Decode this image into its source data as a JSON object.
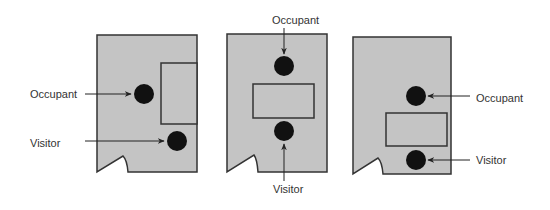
{
  "colors": {
    "room_fill": "#c4c4c4",
    "stroke": "#333333",
    "person": "#111111",
    "text": "#333333",
    "background": "#ffffff"
  },
  "legend_labels": {
    "occupant": "Occupant",
    "visitor": "Visitor"
  },
  "layouts": [
    {
      "id": "layout-1",
      "description": "Desk against right wall; occupant left of desk, visitor below-right near door side",
      "room": {
        "x1": 97,
        "y1": 35,
        "x2": 197,
        "y2": 172
      },
      "door_notch": {
        "left": [
          97,
          172
        ],
        "apex": [
          123,
          156
        ],
        "end": [
          128,
          172
        ]
      },
      "desk": {
        "x": 161,
        "y": 63,
        "w": 36,
        "h": 61
      },
      "occupant": {
        "cx": 144,
        "cy": 94,
        "r": 10,
        "label": "Occupant",
        "label_x": 30,
        "label_y": 98,
        "arrow": [
          [
            85,
            94
          ],
          [
            131,
            94
          ]
        ]
      },
      "visitor": {
        "cx": 177,
        "cy": 141,
        "r": 10,
        "label": "Visitor",
        "label_x": 30,
        "label_y": 147,
        "arrow": [
          [
            85,
            141
          ],
          [
            164,
            141
          ]
        ]
      }
    },
    {
      "id": "layout-2",
      "description": "Desk in center of room; occupant behind desk at top, visitor in front",
      "room": {
        "x1": 227,
        "y1": 34,
        "x2": 327,
        "y2": 172
      },
      "door_notch": {
        "left": [
          227,
          172
        ],
        "apex": [
          254,
          155
        ],
        "end": [
          258,
          172
        ]
      },
      "desk": {
        "x": 253,
        "y": 84,
        "w": 61,
        "h": 34
      },
      "occupant": {
        "cx": 284,
        "cy": 66,
        "r": 10,
        "label": "Occupant",
        "label_x": 272,
        "label_y": 24,
        "arrow": [
          [
            284,
            28
          ],
          [
            284,
            54
          ]
        ]
      },
      "visitor": {
        "cx": 284,
        "cy": 131,
        "r": 10,
        "label": "Visitor",
        "label_x": 273,
        "label_y": 193,
        "arrow": [
          [
            284,
            181
          ],
          [
            284,
            144
          ]
        ]
      }
    },
    {
      "id": "layout-3",
      "description": "Desk in lower center; occupant above desk, visitor between desk and bottom wall",
      "room": {
        "x1": 353,
        "y1": 37,
        "x2": 451,
        "y2": 174
      },
      "door_notch": {
        "left": [
          353,
          174
        ],
        "apex": [
          378,
          158
        ],
        "end": [
          383,
          174
        ]
      },
      "desk": {
        "x": 386,
        "y": 113,
        "w": 61,
        "h": 33
      },
      "occupant": {
        "cx": 416,
        "cy": 96,
        "r": 10,
        "label": "Occupant",
        "label_x": 476,
        "label_y": 102,
        "arrow": [
          [
            470,
            96
          ],
          [
            428,
            96
          ]
        ]
      },
      "visitor": {
        "cx": 416,
        "cy": 160,
        "r": 10,
        "label": "Visitor",
        "label_x": 476,
        "label_y": 164,
        "arrow": [
          [
            470,
            160
          ],
          [
            428,
            160
          ]
        ]
      }
    }
  ]
}
